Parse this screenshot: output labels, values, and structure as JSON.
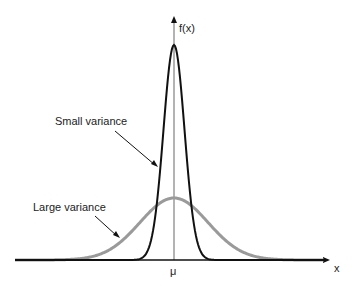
{
  "figure": {
    "y_axis_label": "f(x)",
    "x_axis_label": "x",
    "mean_label": "μ",
    "annotations": [
      {
        "text": "Small variance",
        "curve": "narrow"
      },
      {
        "text": "Large variance",
        "curve": "wide"
      }
    ]
  },
  "chart_data": {
    "type": "line",
    "title": "",
    "xlabel": "x",
    "ylabel": "f(x)",
    "grid": false,
    "series": [
      {
        "name": "Small variance",
        "color": "#111111",
        "distribution": "normal",
        "mean": "μ",
        "relative_sigma": 1,
        "relative_peak": 1.0
      },
      {
        "name": "Large variance",
        "color": "#9a9a9a",
        "distribution": "normal",
        "mean": "μ",
        "relative_sigma": 3.2,
        "relative_peak": 0.3
      }
    ],
    "colors": {
      "axes": "#111111",
      "mean_line": "#9a9a9a"
    }
  }
}
